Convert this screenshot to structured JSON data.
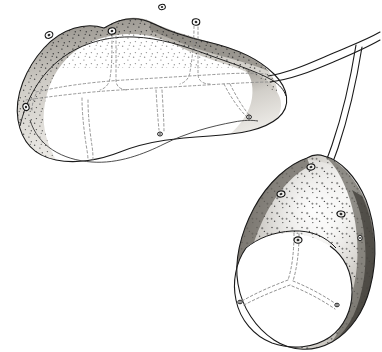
{
  "figure": {
    "background_color": "#ffffff",
    "ink_color": "#1a1a1a",
    "dashed_line_color": "#8c8c8c",
    "stipple_color": "#3d3d3d",
    "shade_light": "#f2f1ee",
    "shade_mid": "#c9c6c0",
    "shade_dark": "#8e8a83",
    "shade_rim": "#5c5852",
    "caption": ""
  },
  "upper_body": {
    "name": "upper-structure",
    "description": "Elongated horizontal lobed body with stippled dorsal band and dashed interior panels",
    "outline_path": "M 104 28 C 86 22 62 28 44 48 C 26 68 14 96 18 120 C 22 144 36 156 56 160 C 76 164 100 160 120 152 C 150 140 180 138 210 136 C 240 134 264 130 278 118 C 292 106 288 88 274 74 C 258 58 234 48 208 42 C 186 37 170 32 154 24 C 136 15 120 18 104 28 Z",
    "dorsal_band_path": "M 104 28 C 86 22 62 28 44 48 C 26 68 14 96 18 120 C 22 144 36 156 56 160 C 48 146 42 128 44 110 C 46 88 56 66 74 52 C 90 40 110 34 130 34 C 150 34 166 40 182 48 C 200 57 222 62 242 70 C 258 77 270 86 276 96 C 280 84 270 70 256 60 C 240 49 216 44 196 38 C 176 32 164 28 152 22 C 134 14 120 18 104 28 Z",
    "ventral_outline_path": "M 28 118 C 36 150 70 162 108 158 C 140 154 176 146 206 140",
    "bottom_seam_path": "M 40 106 C 50 134 72 152 96 158 C 120 164 144 156 164 146 C 186 135 210 126 232 120 C 246 116 256 118 262 120",
    "interior_panels": [
      {
        "id": "panel-left-upper",
        "kind": "dashed-cell"
      },
      {
        "id": "panel-mid-upper",
        "kind": "dashed-cell"
      },
      {
        "id": "panel-right-upper",
        "kind": "dashed-cell"
      },
      {
        "id": "panel-left-lower",
        "kind": "dashed-cell"
      },
      {
        "id": "panel-mid-lower",
        "kind": "dashed-cell"
      },
      {
        "id": "panel-right-lower",
        "kind": "dashed-cell"
      }
    ],
    "eye_markings": [
      {
        "id": "eye-upper-1",
        "cx": 49,
        "cy": 35,
        "rx": 4.0,
        "ry": 3.2,
        "rotate": -28
      },
      {
        "id": "eye-upper-2",
        "cx": 112,
        "cy": 31,
        "rx": 3.8,
        "ry": 3.2,
        "rotate": -8
      },
      {
        "id": "eye-upper-3",
        "cx": 162,
        "cy": 7,
        "rx": 3.4,
        "ry": 2.6,
        "rotate": -12
      },
      {
        "id": "eye-upper-4",
        "cx": 196,
        "cy": 22,
        "rx": 3.8,
        "ry": 3.2,
        "rotate": 6
      },
      {
        "id": "eye-upper-5",
        "cx": 26,
        "cy": 107,
        "rx": 3.6,
        "ry": 3.0,
        "rotate": 70
      },
      {
        "id": "node-upper-right",
        "cx": 249,
        "cy": 117,
        "rx": 2.4,
        "ry": 2.0,
        "rotate": 0
      },
      {
        "id": "node-upper-bottom",
        "cx": 160,
        "cy": 134,
        "rx": 2.4,
        "ry": 2.0,
        "rotate": 0
      }
    ]
  },
  "ribbon": {
    "name": "connecting-ribbon",
    "description": "Double-line band leaving the right end of the upper body, running right then bending down to the lower body",
    "upper_edge_path": "M 268 76 C 292 72 312 62 336 52 C 352 45 366 40 380 32",
    "lower_edge_path": "M 270 82 C 294 79 314 70 338 60 C 352 54 366 48 380 40",
    "branch_outer_path": "M 356 45 C 352 70 344 110 332 145 C 326 162 320 178 314 188",
    "branch_inner_path": "M 362 47 C 358 72 350 112 338 148 C 332 165 326 180 320 190",
    "junction_point": {
      "x": 357,
      "y": 45
    }
  },
  "lower_body": {
    "name": "lower-structure",
    "description": "Teardrop/oval body with stippled upper surface, dark rim, and white lower cap divided by dashed Y-shaped seams",
    "outline_path": "M 307 158 C 289 164 268 182 254 208 C 240 234 234 262 238 284 C 242 308 256 328 274 340 C 292 352 314 352 332 342 C 350 332 364 312 370 288 C 378 258 376 226 366 200 C 356 176 340 160 324 156 C 318 154 312 155 307 158 Z",
    "rim_dark_left_path": "M 307 158 C 289 164 268 182 254 208 C 240 234 234 262 238 284 C 246 268 252 244 262 222 C 274 196 292 174 310 166 Z",
    "rim_dark_right_path": "M 324 156 C 342 162 356 180 366 202 C 376 228 378 258 370 288 C 364 312 350 332 332 342 C 344 324 352 300 356 274 C 360 244 356 210 344 184 C 338 170 331 161 324 156 Z",
    "cap_outline_path": "M 246 248 C 236 262 232 282 236 300 C 240 320 254 336 272 343 C 292 350 314 348 330 337 C 344 327 352 310 352 292 C 352 272 344 256 330 246",
    "cap_top_arc_path": "M 246 248 C 258 238 274 232 292 231 C 312 230 326 237 336 248",
    "seam_center_path": "M 296 233 C 296 252 294 268 290 280",
    "seam_left_path": "M 290 280 C 274 286 258 292 244 300",
    "seam_right_path": "M 290 280 C 306 286 322 294 336 304",
    "eye_markings": [
      {
        "id": "eye-lower-1",
        "cx": 311,
        "cy": 167,
        "rx": 4.0,
        "ry": 3.0,
        "rotate": -14
      },
      {
        "id": "eye-lower-2",
        "cx": 281,
        "cy": 194,
        "rx": 4.0,
        "ry": 3.0,
        "rotate": -10
      },
      {
        "id": "eye-lower-3",
        "cx": 341,
        "cy": 214,
        "rx": 4.0,
        "ry": 3.0,
        "rotate": 8
      },
      {
        "id": "eye-lower-4",
        "cx": 298,
        "cy": 240,
        "rx": 4.0,
        "ry": 3.2,
        "rotate": 0
      },
      {
        "id": "node-lower-right",
        "cx": 360,
        "cy": 238,
        "rx": 2.2,
        "ry": 2.8,
        "rotate": 0
      },
      {
        "id": "node-cap-left",
        "cx": 240,
        "cy": 302,
        "rx": 2.2,
        "ry": 1.8,
        "rotate": 0
      },
      {
        "id": "node-cap-right",
        "cx": 337,
        "cy": 305,
        "rx": 2.2,
        "ry": 1.8,
        "rotate": 0
      }
    ]
  },
  "texture": {
    "stipple_dot_radius": 0.75,
    "cross_mark_size": 2.2,
    "upper_dot_count": 210,
    "lower_dot_count": 190
  }
}
